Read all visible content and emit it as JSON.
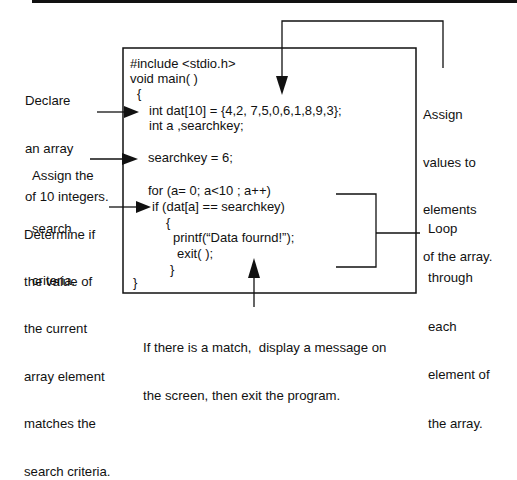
{
  "colors": {
    "ink": "#111111",
    "background": "#ffffff",
    "top_bar": "#111111"
  },
  "code": {
    "lines": [
      "#include <stdio.h>",
      "void main( )",
      "{",
      "int dat[10] = {4,2, 7,5,0,6,1,8,9,3};",
      "int a ,searchkey;",
      "searchkey = 6;",
      "for (a= 0; a<10 ; a++)",
      "if (dat[a] == searchkey)",
      "{",
      "printf(“Data fournd!”);",
      "exit( );",
      "}",
      "}"
    ]
  },
  "callouts": {
    "declare_array": [
      "Declare",
      "an array",
      "of 10 integers."
    ],
    "assign_criteria": [
      "Assign the",
      "search",
      "criteria."
    ],
    "determine_match": [
      "Determine if",
      "the value of",
      "the current",
      "array element",
      "matches the",
      "search criteria."
    ],
    "assign_values": [
      "Assign",
      "values to",
      "elements",
      "of the array."
    ],
    "loop": [
      "Loop",
      "through",
      "each",
      "element of",
      "the array."
    ],
    "match_message": [
      "If there is a match,  display a message on",
      "the screen, then exit the program."
    ]
  }
}
